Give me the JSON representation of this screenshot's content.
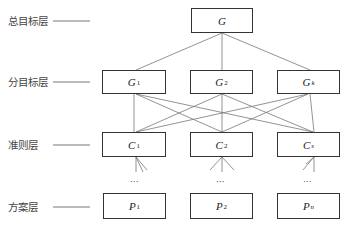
{
  "diagram": {
    "type": "hierarchy (AHP structure)",
    "layers": [
      {
        "id": "goal",
        "label": "总目标层",
        "nodes": [
          {
            "symbol": "G",
            "sub": ""
          }
        ]
      },
      {
        "id": "subgoal",
        "label": "分目标层",
        "nodes": [
          {
            "symbol": "G",
            "sub": "1"
          },
          {
            "symbol": "G",
            "sub": "2"
          },
          {
            "symbol": "G",
            "sub": "k"
          }
        ]
      },
      {
        "id": "criteria",
        "label": "准则层",
        "nodes": [
          {
            "symbol": "C",
            "sub": "1"
          },
          {
            "symbol": "C",
            "sub": "2"
          },
          {
            "symbol": "C",
            "sub": "s"
          }
        ]
      },
      {
        "id": "alternatives",
        "label": "方案层",
        "nodes": [
          {
            "symbol": "P",
            "sub": "1"
          },
          {
            "symbol": "P",
            "sub": "2"
          },
          {
            "symbol": "P",
            "sub": "n"
          }
        ]
      }
    ],
    "ellipsis": "···",
    "colors": {
      "line": "#666666",
      "box_border": "#333333",
      "text": "#333333"
    }
  }
}
